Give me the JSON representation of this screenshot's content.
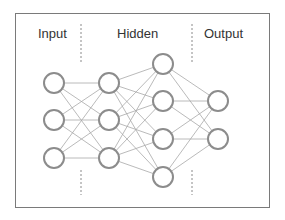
{
  "diagram": {
    "title": "",
    "layer_labels": {
      "input": "Input",
      "hidden": "Hidden",
      "output": "Output"
    },
    "layers": [
      {
        "name": "input",
        "x": 54,
        "nodes": [
          83,
          120,
          158
        ]
      },
      {
        "name": "hidden1",
        "x": 109,
        "nodes": [
          83,
          120,
          158
        ]
      },
      {
        "name": "hidden2",
        "x": 163,
        "nodes": [
          64,
          101,
          139,
          177
        ]
      },
      {
        "name": "output",
        "x": 218,
        "nodes": [
          101,
          139
        ]
      }
    ],
    "node_radius": 10,
    "colors": {
      "node_stroke": "#8c8c8c",
      "edge": "#a8a8a8",
      "divider": "#8a8a8a",
      "frame": "#7a7a7a"
    }
  }
}
